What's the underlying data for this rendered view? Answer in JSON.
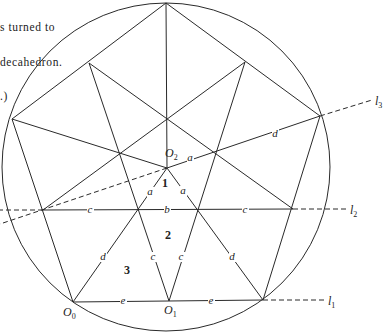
{
  "caption": {
    "lines": [
      "s turned to",
      "decahedron.",
      ".)"
    ]
  },
  "diagram": {
    "circle": {
      "cx": 166,
      "cy": 167,
      "r": 164
    },
    "points": {
      "T": [
        166,
        3
      ],
      "L": [
        12,
        119
      ],
      "R": [
        320,
        116
      ],
      "UL": [
        89,
        63
      ],
      "UR": [
        245,
        62
      ],
      "C": [
        167,
        119
      ],
      "O2": [
        167,
        168
      ],
      "P1": [
        119,
        153
      ],
      "P2": [
        215,
        153
      ],
      "Q0": [
        43,
        210
      ],
      "Q1": [
        137,
        209
      ],
      "Q2": [
        197,
        209
      ],
      "Q3": [
        293,
        209
      ],
      "O0": [
        73,
        302
      ],
      "O1": [
        169,
        301
      ],
      "B": [
        263,
        300
      ]
    },
    "solid_lines": [
      [
        "T",
        "L"
      ],
      [
        "T",
        "R"
      ],
      [
        "T",
        "O2"
      ],
      [
        "UL",
        "Q3"
      ],
      [
        "UR",
        "Q0"
      ],
      [
        "UL",
        "O1"
      ],
      [
        "UR",
        "O1"
      ],
      [
        "L",
        "O2"
      ],
      [
        "O2",
        "R"
      ],
      [
        "L",
        "O0"
      ],
      [
        "R",
        "B"
      ],
      [
        "O0",
        "O2"
      ],
      [
        "B",
        "O2"
      ],
      [
        "Q0",
        "Q3"
      ],
      [
        "O0",
        "B"
      ]
    ],
    "dashed_lines": [
      {
        "name": "l3-extension-right",
        "from": [
          320,
          116
        ],
        "to": [
          372,
          100
        ]
      },
      {
        "name": "l3-extension-left",
        "from": [
          167,
          168
        ],
        "to": [
          0,
          224
        ]
      },
      {
        "name": "l2-extension-left",
        "from": [
          43,
          210
        ],
        "to": [
          0,
          210
        ]
      },
      {
        "name": "l2-extension-right",
        "from": [
          293,
          209
        ],
        "to": [
          346,
          209
        ]
      },
      {
        "name": "l1-extension-right",
        "from": [
          263,
          300
        ],
        "to": [
          324,
          300
        ]
      }
    ],
    "edge_labels": [
      {
        "name": "label-a-o2-right",
        "text": "a",
        "x": 190,
        "y": 161
      },
      {
        "name": "label-d-o2-r",
        "text": "d",
        "x": 275,
        "y": 137
      },
      {
        "name": "label-a-left",
        "text": "a",
        "x": 150,
        "y": 195
      },
      {
        "name": "label-a-right",
        "text": "a",
        "x": 183,
        "y": 194
      },
      {
        "name": "label-c-l2-left",
        "text": "c",
        "x": 90,
        "y": 213
      },
      {
        "name": "label-b-l2",
        "text": "b",
        "x": 167,
        "y": 213
      },
      {
        "name": "label-c-l2-right",
        "text": "c",
        "x": 245,
        "y": 213
      },
      {
        "name": "label-d-o0",
        "text": "d",
        "x": 103,
        "y": 260
      },
      {
        "name": "label-c-o1-left",
        "text": "c",
        "x": 153,
        "y": 260
      },
      {
        "name": "label-c-o1-right",
        "text": "c",
        "x": 181,
        "y": 260
      },
      {
        "name": "label-d-b",
        "text": "d",
        "x": 232,
        "y": 260
      },
      {
        "name": "label-e-left",
        "text": "e",
        "x": 123,
        "y": 304
      },
      {
        "name": "label-e-right",
        "text": "e",
        "x": 211,
        "y": 304
      }
    ],
    "region_labels": [
      {
        "name": "region-1",
        "text": "1",
        "x": 165,
        "y": 187
      },
      {
        "name": "region-2",
        "text": "2",
        "x": 168,
        "y": 239
      },
      {
        "name": "region-3",
        "text": "3",
        "x": 127,
        "y": 274
      }
    ],
    "point_labels": [
      {
        "name": "point-o2",
        "base": "O",
        "sub": "2",
        "x": 165,
        "y": 157
      },
      {
        "name": "point-o0",
        "base": "O",
        "sub": "0",
        "x": 63,
        "y": 316
      },
      {
        "name": "point-o1",
        "base": "O",
        "sub": "1",
        "x": 164,
        "y": 314
      }
    ],
    "line_labels": [
      {
        "name": "line-l3",
        "base": "l",
        "sub": "3",
        "x": 375,
        "y": 105
      },
      {
        "name": "line-l2",
        "base": "l",
        "sub": "2",
        "x": 350,
        "y": 214
      },
      {
        "name": "line-l1",
        "base": "l",
        "sub": "1",
        "x": 328,
        "y": 305
      }
    ]
  }
}
